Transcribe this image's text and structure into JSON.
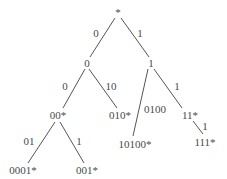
{
  "diagram": {
    "type": "binary-trie",
    "nodes": [
      {
        "id": "root",
        "label": "*"
      },
      {
        "id": "n0",
        "label": "0"
      },
      {
        "id": "n1",
        "label": "1"
      },
      {
        "id": "n00",
        "label": "00*"
      },
      {
        "id": "n010",
        "label": "010*"
      },
      {
        "id": "n10100",
        "label": "10100*"
      },
      {
        "id": "n11",
        "label": "11*"
      },
      {
        "id": "n111",
        "label": "111*"
      },
      {
        "id": "n0001",
        "label": "0001*"
      },
      {
        "id": "n001",
        "label": "001*"
      }
    ],
    "edges": [
      {
        "from": "root",
        "to": "n0",
        "label": "0"
      },
      {
        "from": "root",
        "to": "n1",
        "label": "1"
      },
      {
        "from": "n0",
        "to": "n00",
        "label": "0"
      },
      {
        "from": "n0",
        "to": "n010",
        "label": "10"
      },
      {
        "from": "n1",
        "to": "n10100",
        "label": "0100"
      },
      {
        "from": "n1",
        "to": "n11",
        "label": "1"
      },
      {
        "from": "n11",
        "to": "n111",
        "label": "1"
      },
      {
        "from": "n00",
        "to": "n0001",
        "label": "01"
      },
      {
        "from": "n00",
        "to": "n001",
        "label": "1"
      }
    ]
  }
}
